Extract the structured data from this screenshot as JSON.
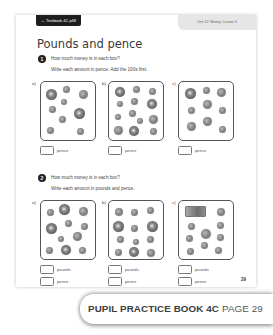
{
  "header": {
    "textbook_ref": "← Textbook 4C p48",
    "unit_label": "Unit 12: Money, Lesson 3"
  },
  "title": "Pounds and pence",
  "questions": [
    {
      "number": "1",
      "prompt": "How much money is in each box?",
      "instruction": "Write each amount in pence. Add the 100s first.",
      "parts": [
        {
          "label": "a)",
          "answer_label": "pence"
        },
        {
          "label": "b)",
          "answer_label": "pence"
        },
        {
          "label": "c)",
          "answer_label": "pence"
        }
      ]
    },
    {
      "number": "2",
      "prompt": "How much money is in each box?",
      "instruction": "Write each amount in pounds and pence.",
      "parts": [
        {
          "label": "a)",
          "pounds_label": "pounds",
          "pence_label": "pence"
        },
        {
          "label": "b)",
          "pounds_label": "pounds",
          "pence_label": "pence"
        },
        {
          "label": "c)",
          "pounds_label": "pounds",
          "pence_label": "pence"
        }
      ]
    }
  ],
  "page_number": "29",
  "caption": {
    "book": "PUPIL PRACTICE BOOK 4C",
    "page": "PAGE 29"
  },
  "colors": {
    "ref_tab_bg": "#1e1e1e",
    "unit_tab_bg": "#e6e6e6",
    "box_border": "#555555"
  }
}
